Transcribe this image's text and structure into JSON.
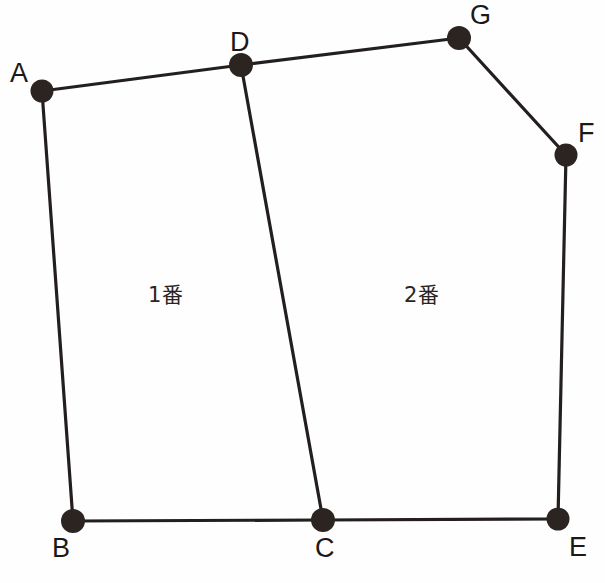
{
  "figure": {
    "canvas": {
      "width": 605,
      "height": 583,
      "background": "#fefefe"
    },
    "style": {
      "line_color": "#231f1e",
      "line_width": 3.2,
      "dot_color": "#2b2421",
      "dot_radius": 11.5,
      "label_color": "#1c1818"
    },
    "vertices": [
      {
        "id": "A",
        "label": "A",
        "x": 42,
        "y": 91,
        "label_x": 10,
        "label_y": 60,
        "dot_r": 11.5
      },
      {
        "id": "D",
        "label": "D",
        "x": 241,
        "y": 65,
        "label_x": 230,
        "label_y": 29,
        "dot_r": 12.0
      },
      {
        "id": "G",
        "label": "G",
        "x": 459,
        "y": 38,
        "label_x": 470,
        "label_y": 2,
        "dot_r": 12.0
      },
      {
        "id": "F",
        "label": "F",
        "x": 566,
        "y": 155,
        "label_x": 578,
        "label_y": 120,
        "dot_r": 11.5
      },
      {
        "id": "E",
        "label": "E",
        "x": 558,
        "y": 519,
        "label_x": 569,
        "label_y": 534,
        "dot_r": 11.5
      },
      {
        "id": "C",
        "label": "C",
        "x": 323,
        "y": 520,
        "label_x": 315,
        "label_y": 535,
        "dot_r": 12.0
      },
      {
        "id": "B",
        "label": "B",
        "x": 73,
        "y": 521,
        "label_x": 52,
        "label_y": 535,
        "dot_r": 12.0
      }
    ],
    "edges": [
      {
        "id": "A-D",
        "from": "A",
        "to": "D"
      },
      {
        "id": "D-G",
        "from": "D",
        "to": "G"
      },
      {
        "id": "G-F",
        "from": "G",
        "to": "F"
      },
      {
        "id": "F-E",
        "from": "F",
        "to": "E"
      },
      {
        "id": "E-C",
        "from": "E",
        "to": "C"
      },
      {
        "id": "C-B",
        "from": "C",
        "to": "B"
      },
      {
        "id": "B-A",
        "from": "B",
        "to": "A"
      },
      {
        "id": "D-C",
        "from": "D",
        "to": "C"
      }
    ],
    "regions": [
      {
        "id": "region-1",
        "label": "1番",
        "label_x": 148,
        "label_y": 285,
        "boundary": [
          "A",
          "D",
          "C",
          "B"
        ]
      },
      {
        "id": "region-2",
        "label": "2番",
        "label_x": 404,
        "label_y": 285,
        "boundary": [
          "D",
          "G",
          "F",
          "E",
          "C"
        ]
      }
    ]
  }
}
